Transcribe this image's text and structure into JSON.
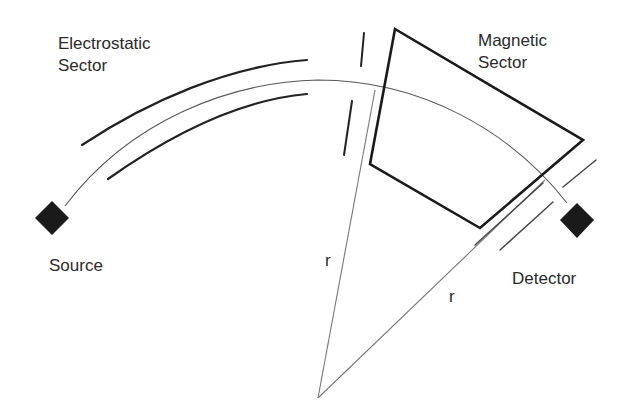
{
  "diagram": {
    "labels": {
      "electrostatic_line1": "Electrostatic",
      "electrostatic_line2": "Sector",
      "magnetic_line1": "Magnetic",
      "magnetic_line2": "Sector",
      "source": "Source",
      "detector": "Detector",
      "radius_left": "r",
      "radius_right": "r"
    },
    "components": [
      {
        "name": "Source",
        "shape": "filled-diamond"
      },
      {
        "name": "Electrostatic Sector",
        "shape": "two curved plates"
      },
      {
        "name": "Intermediate slit",
        "shape": "slit"
      },
      {
        "name": "Magnetic Sector",
        "shape": "quadrilateral"
      },
      {
        "name": "Exit slit",
        "shape": "slit"
      },
      {
        "name": "Detector",
        "shape": "filled-diamond"
      }
    ],
    "colors": {
      "line": "#222222",
      "background": "#ffffff"
    }
  }
}
